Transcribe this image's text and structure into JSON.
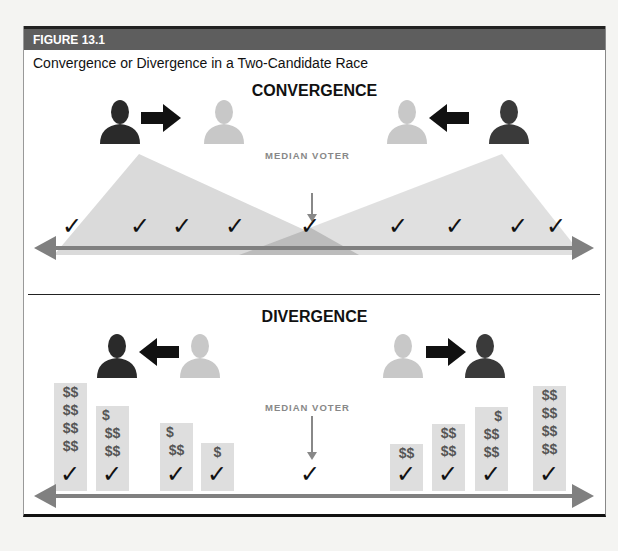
{
  "figure": {
    "label": "FIGURE 13.1",
    "caption": "Convergence or Divergence in a Two-Candidate Race"
  },
  "convergence": {
    "title": "CONVERGENCE",
    "median_label": "MEDIAN VOTER",
    "left_candidate": {
      "start": "dark",
      "arrow": "right",
      "end": "light"
    },
    "right_candidate": {
      "start": "dark",
      "arrow": "left",
      "end": "light"
    },
    "voter_checks": 9,
    "check_symbol": "✓"
  },
  "divergence": {
    "title": "DIVERGENCE",
    "median_label": "MEDIAN VOTER",
    "left_candidate": {
      "start": "light",
      "arrow": "left",
      "end": "dark"
    },
    "right_candidate": {
      "start": "light",
      "arrow": "right",
      "end": "dark"
    },
    "check_symbol": "✓",
    "columns": [
      {
        "lines": [
          "$$",
          "$$",
          "$$",
          "$$"
        ]
      },
      {
        "lines": [
          "$",
          "$$",
          "$$"
        ]
      },
      {
        "lines": [
          "$",
          "$$"
        ]
      },
      {
        "lines": [
          "$"
        ]
      },
      {
        "lines": []
      },
      {
        "lines": [
          "$$"
        ]
      },
      {
        "lines": [
          "$$",
          "$$"
        ]
      },
      {
        "lines": [
          "$",
          "$$",
          "$$"
        ]
      },
      {
        "lines": [
          "$$",
          "$$",
          "$$",
          "$$"
        ]
      }
    ]
  },
  "colors": {
    "header_bg": "#5e5e5e",
    "dark_person": "#2a2a2a",
    "light_person": "#c8c8c8",
    "axis": "#808080",
    "triangle": "#dadada",
    "overlap": "#bcbcbc",
    "money_col": "#dedede"
  }
}
